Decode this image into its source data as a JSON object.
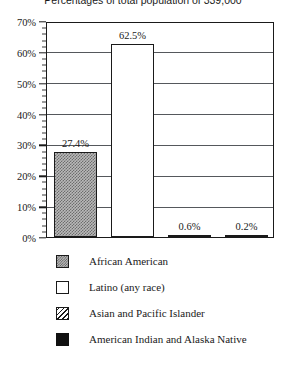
{
  "chart_data": {
    "type": "bar",
    "title": "Percentages of total population of 339,000",
    "xlabel": "",
    "ylabel": "",
    "ylim": [
      0,
      70
    ],
    "ytick_step": 10,
    "yminor_step": 2,
    "grid": true,
    "legend_position": "bottom",
    "categories": [
      "African American",
      "Latino (any race)",
      "Asian and Pacific Islander",
      "American Indian and Alaska Native"
    ],
    "values": [
      27.4,
      62.5,
      0.6,
      0.2
    ],
    "data_labels": [
      "27.4%",
      "62.5%",
      "0.6%",
      "0.2%"
    ],
    "ytick_labels": [
      "70%",
      "60%",
      "50%",
      "40%",
      "30%",
      "20%",
      "10%",
      "0%"
    ],
    "ytick_values": [
      70,
      60,
      50,
      40,
      30,
      20,
      10,
      0
    ],
    "series_fill": [
      "hatch",
      "white",
      "diagonal",
      "solid"
    ],
    "colors": {
      "axis": "#1a1a1a",
      "grid": "#55585c",
      "bar_hatch_fill": "#b9b9b9",
      "bar_white_fill": "#ffffff",
      "bar_solid_fill": "#111111",
      "background": "#ffffff"
    }
  },
  "legend": {
    "items": [
      {
        "label": "African American",
        "swatch": "hatch-swatch"
      },
      {
        "label": "Latino (any race)",
        "swatch": "white-swatch"
      },
      {
        "label": "Asian and Pacific Islander",
        "swatch": "diagonal-swatch"
      },
      {
        "label": "American Indian and Alaska Native",
        "swatch": "solid-swatch"
      }
    ]
  }
}
